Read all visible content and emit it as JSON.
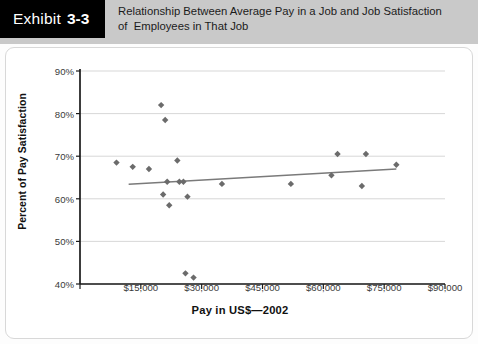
{
  "header": {
    "exhibit_label": "Exhibit",
    "exhibit_number": "3-3",
    "title_line1": "Relationship Between Average Pay in a Job and Job Satisfaction",
    "title_line2": "of  Employees in That Job"
  },
  "colors": {
    "header_band": "#c9c9c9",
    "exhibit_box": "#000000",
    "exhibit_text": "#ffffff",
    "marker": "#6b6b6b",
    "trendline": "#7a7a7a",
    "gridline": "#d2d2d2",
    "axis": "#1a1a1a",
    "panel_bg": "#ffffff"
  },
  "chart_data": {
    "type": "scatter",
    "title": "Relationship Between Average Pay in a Job and Job Satisfaction of Employees in That Job",
    "xlabel": "Pay in US$—2002",
    "ylabel": "Percent of Pay Satisfaction",
    "xlim": [
      0,
      90000
    ],
    "ylim": [
      40,
      90
    ],
    "xticks": [
      0,
      15000,
      30000,
      45000,
      60000,
      75000,
      90000
    ],
    "xticklabels": [
      "",
      "$15,000",
      "$30,000",
      "$45,000",
      "$60,000",
      "$75,000",
      "$90,000"
    ],
    "yticks": [
      40,
      50,
      60,
      70,
      80,
      90
    ],
    "yticklabels": [
      "40%",
      "50%",
      "60%",
      "70%",
      "80%",
      "90%"
    ],
    "grid": "horizontal",
    "legend": "none",
    "marker_shape": "diamond",
    "points": [
      {
        "x": 9000,
        "y": 68.5
      },
      {
        "x": 13000,
        "y": 67.5
      },
      {
        "x": 17000,
        "y": 67.0
      },
      {
        "x": 20000,
        "y": 82.0
      },
      {
        "x": 21000,
        "y": 78.5
      },
      {
        "x": 20500,
        "y": 61.0
      },
      {
        "x": 21500,
        "y": 64.0
      },
      {
        "x": 22000,
        "y": 58.5
      },
      {
        "x": 24000,
        "y": 69.0
      },
      {
        "x": 24500,
        "y": 64.0
      },
      {
        "x": 25500,
        "y": 64.0
      },
      {
        "x": 26500,
        "y": 60.5
      },
      {
        "x": 26000,
        "y": 42.5
      },
      {
        "x": 28000,
        "y": 41.5
      },
      {
        "x": 35000,
        "y": 63.5
      },
      {
        "x": 52000,
        "y": 63.5
      },
      {
        "x": 62000,
        "y": 65.5
      },
      {
        "x": 63500,
        "y": 70.5
      },
      {
        "x": 69500,
        "y": 63.0
      },
      {
        "x": 70500,
        "y": 70.5
      },
      {
        "x": 78000,
        "y": 68.0
      }
    ],
    "trendline": {
      "x0": 12000,
      "y0": 63.4,
      "x1": 78000,
      "y1": 67.0
    }
  }
}
